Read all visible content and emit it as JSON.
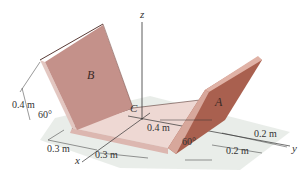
{
  "figure": {
    "type": "3d-plate-assembly",
    "colors": {
      "plate_face": "#c79a92",
      "plate_face_dark": "#a0574a",
      "plate_edge": "#e3c7c1",
      "floor": "#eed8d3",
      "floor_edge": "#dcb7b0",
      "shadow": "#d6dbd6",
      "line": "#333333"
    },
    "axes": {
      "x": "x",
      "y": "y",
      "z": "z"
    },
    "plates": {
      "B": "B",
      "A": "A"
    },
    "point": "C",
    "dimensions": {
      "plate_b_height": "0.4 m",
      "angle_b": "60°",
      "base_x_1": "0.3 m",
      "base_x_2": "0.3 m",
      "center_offset": "0.4 m",
      "angle_a": "60°",
      "base_y_1": "0.2 m",
      "base_y_2": "0.2 m"
    }
  }
}
